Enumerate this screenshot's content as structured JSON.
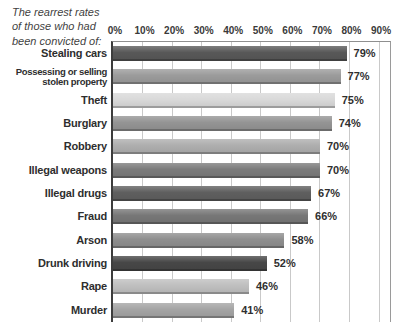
{
  "title": "The rearrest rates\nof those who had\nbeen convicted of:",
  "chart_data": {
    "type": "bar",
    "orientation": "horizontal",
    "title": "The rearrest rates of those who had been convicted of:",
    "categories": [
      "Stealing cars",
      "Possessing or selling\nstolen property",
      "Theft",
      "Burglary",
      "Robbery",
      "Illegal weapons",
      "Illegal drugs",
      "Fraud",
      "Arson",
      "Drunk driving",
      "Rape",
      "Murder"
    ],
    "values": [
      79,
      77,
      75,
      74,
      70,
      70,
      67,
      66,
      58,
      52,
      46,
      41
    ],
    "value_labels": [
      "79%",
      "77%",
      "75%",
      "74%",
      "70%",
      "70%",
      "67%",
      "66%",
      "58%",
      "52%",
      "46%",
      "41%"
    ],
    "x_ticks": [
      "0%",
      "10%",
      "20%",
      "30%",
      "40%",
      "50%",
      "60%",
      "70%",
      "80%",
      "90%"
    ],
    "xlim": [
      0,
      94
    ],
    "grid": true,
    "legend_position": "none",
    "gridline_color": "#c9c9c9",
    "axis_color": "#3d3d3d",
    "bar_colors": [
      "#585858",
      "#9b9b9b",
      "#d9d9d9",
      "#949494",
      "#aeaeae",
      "#7b7b7b",
      "#5f5f5f",
      "#777777",
      "#8e8e8e",
      "#474747",
      "#bfbfbf",
      "#a4a4a4"
    ]
  }
}
